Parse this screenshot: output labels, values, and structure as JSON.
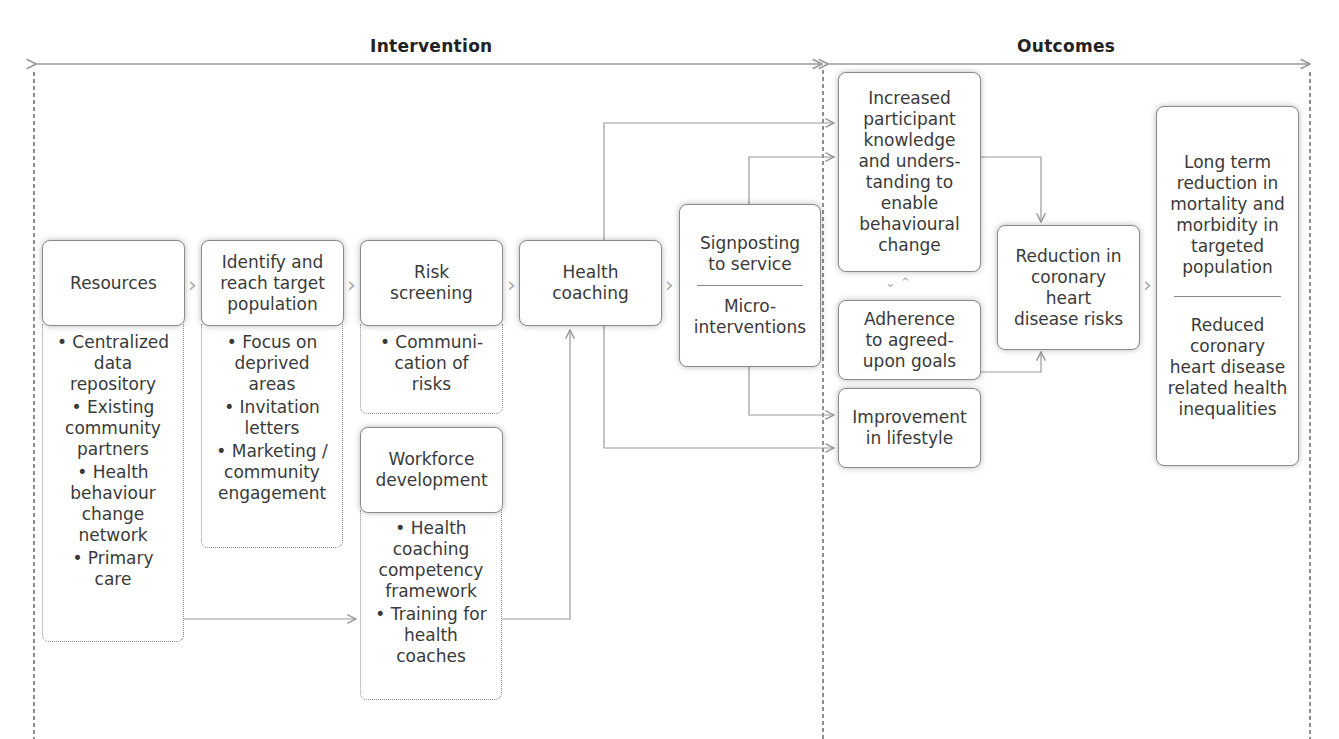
{
  "sections": {
    "intervention": "Intervention",
    "outcomes": "Outcomes"
  },
  "boxes": {
    "resources": {
      "title": "Resources",
      "items": [
        "• Centralized\ndata\nrepository",
        "• Existing\ncommunity\npartners",
        "• Health\nbehaviour\nchange\nnetwork",
        "• Primary\ncare"
      ]
    },
    "identify": {
      "title": "Identify and\nreach target\npopulation",
      "items": [
        "• Focus on\ndeprived\nareas",
        "• Invitation\nletters",
        "• Marketing /\ncommunity\nengagement"
      ]
    },
    "risk_screening": {
      "title": "Risk\nscreening",
      "items": [
        "• Communi-\ncation of\nrisks"
      ]
    },
    "workforce": {
      "title": "Workforce\ndevelopment",
      "items": [
        "• Health\ncoaching\ncompetency\nframework",
        "• Training for\nhealth\ncoaches"
      ]
    },
    "health_coaching": {
      "title": "Health\ncoaching"
    },
    "signposting": {
      "top": "Signposting\nto service",
      "bottom": "Micro-\ninterventions"
    },
    "knowledge": {
      "title": "Increased\nparticipant\nknowledge\nand unders-\ntanding to\nenable\nbehavioural\nchange"
    },
    "adherence": {
      "title": "Adherence\nto agreed-\nupon goals"
    },
    "lifestyle": {
      "title": "Improvement\nin lifestyle"
    },
    "chd_risk": {
      "title": "Reduction in\ncoronary\nheart\ndisease risks"
    },
    "long_term": {
      "top": "Long term\nreduction in\nmortality and\nmorbidity in\ntargeted\npopulation",
      "bottom": "Reduced\ncoronary\nheart disease\nrelated health\ninequalities"
    }
  },
  "connectors": {
    "chevron": "›",
    "bidirectional": "⌄⌃"
  },
  "colors": {
    "line": "#9a9a9a",
    "border": "#8a8a8a",
    "text": "#3a3a3a",
    "header": "#222222"
  }
}
